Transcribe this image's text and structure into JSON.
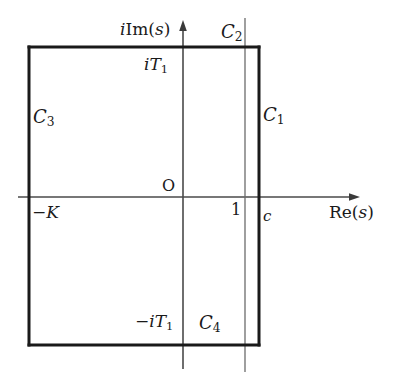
{
  "figure": {
    "background_color": "#ffffff",
    "stroke_color": "#1a1a1a",
    "axis_color": "#4a4a4a"
  },
  "axes": {
    "real": {
      "label": "Re(s)",
      "label_parts": {
        "prefix": "Re(",
        "variable": "s",
        "suffix": ")"
      },
      "arrow": "right",
      "y": 197,
      "x_start": 18,
      "x_end": 358
    },
    "imaginary": {
      "label": "iIm(s)",
      "label_parts": {
        "i": "i",
        "prefix": "Im(",
        "variable": "s",
        "suffix": ")"
      },
      "arrow": "up",
      "x": 183,
      "y_start": 369,
      "y_end": 22
    },
    "origin_label": "O"
  },
  "contour": {
    "name": "rectangle",
    "left": 29,
    "top": 47,
    "right": 259,
    "bottom": 345,
    "stroke_width": 3,
    "segments": [
      {
        "id": "C1",
        "label": "C",
        "subscript": "1",
        "side": "right",
        "description": "right vertical edge at Re(s)=c"
      },
      {
        "id": "C2",
        "label": "C",
        "subscript": "2",
        "side": "top",
        "description": "top horizontal edge at Im(s)=T1"
      },
      {
        "id": "C3",
        "label": "C",
        "subscript": "3",
        "side": "left",
        "description": "left vertical edge at Re(s)=-K"
      },
      {
        "id": "C4",
        "label": "C",
        "subscript": "4",
        "side": "bottom",
        "description": "bottom horizontal edge at Im(s)=-T1"
      }
    ]
  },
  "guide_line": {
    "description": "thin vertical line at Re(s)=1",
    "x": 245,
    "y_start": 18,
    "y_end": 372,
    "stroke_width": 1
  },
  "markers": {
    "top_imag": {
      "text": "iT1",
      "parts": {
        "i": "i",
        "base": "T",
        "sub": "1"
      }
    },
    "bottom_imag": {
      "text": "-iT1",
      "parts": {
        "minus": "−",
        "i": "i",
        "base": "T",
        "sub": "1"
      }
    },
    "left_real": {
      "text": "-K",
      "parts": {
        "minus": "−",
        "base": "K"
      }
    },
    "unit_real": {
      "text": "1"
    },
    "abscissa": {
      "text": "c"
    }
  }
}
